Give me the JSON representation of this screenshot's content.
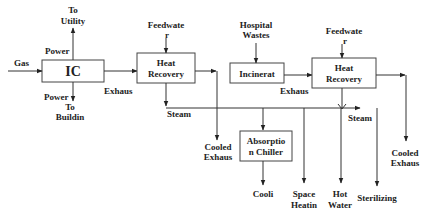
{
  "diagram": {
    "blocks": {
      "ic": "IC",
      "hr1_line1": "Heat",
      "hr1_line2": "Recovery",
      "incin": "Incinerat",
      "hr2_line1": "Heat",
      "hr2_line2": "Recovery",
      "chiller_line1": "Absorptio",
      "chiller_line2": "n Chiller"
    },
    "labels": {
      "gas": "Gas",
      "to_utility_1": "To",
      "to_utility_2": "Utility",
      "power_top": "Power",
      "power_bottom": "Power",
      "to_building_1": "To",
      "to_building_2": "Buildin",
      "exhaust_1": "Exhaus",
      "feedwater1_1": "Feedwate",
      "feedwater1_2": "r",
      "steam_1": "Steam",
      "cooled_exhaust1_1": "Cooled",
      "cooled_exhaust1_2": "Exhaus",
      "hospital_1": "Hospital",
      "hospital_2": "Wastes",
      "exhaust_2": "Exhaus",
      "feedwater2_1": "Feedwate",
      "feedwater2_2": "r",
      "steam_2": "Steam",
      "cooling": "Cooli",
      "space_heating_1": "Space",
      "space_heating_2": "Heatin",
      "hot_water_1": "Hot",
      "hot_water_2": "Water",
      "sterilizing": "Sterilizing",
      "cooled_exhaust2_1": "Cooled",
      "cooled_exhaust2_2": "Exhaus"
    }
  }
}
